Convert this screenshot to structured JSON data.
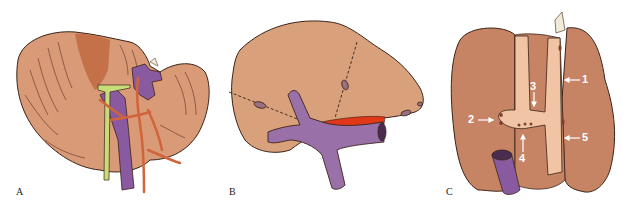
{
  "figure": {
    "panels": [
      {
        "id": "A",
        "label": "A",
        "subject": "liver-anterior-view-with-vessels"
      },
      {
        "id": "B",
        "label": "B",
        "subject": "liver-with-segment-divisions-and-veins"
      },
      {
        "id": "C",
        "label": "C",
        "subject": "liver-inferior-view-with-numbered-landmarks"
      }
    ],
    "callouts": [
      {
        "number": "1",
        "panel": "C"
      },
      {
        "number": "2",
        "panel": "C"
      },
      {
        "number": "3",
        "panel": "C"
      },
      {
        "number": "4",
        "panel": "C"
      },
      {
        "number": "5",
        "panel": "C"
      }
    ],
    "colors": {
      "liver": "#d99a78",
      "liver_dark": "#c87c58",
      "liver_pale": "#f0c4a4",
      "outline": "#3a2418",
      "vein_purple": "#8a5aa0",
      "artery_orange": "#d0643a",
      "duct_green": "#c8dc78",
      "highlight_red": "#e03818",
      "hatch": "#5a3020"
    }
  }
}
